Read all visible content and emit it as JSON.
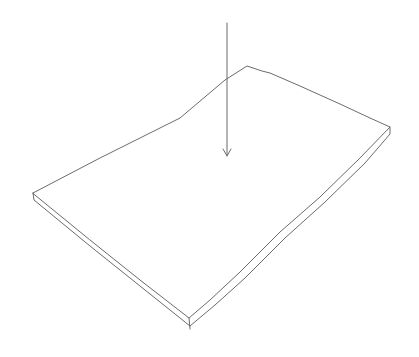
{
  "figure": {
    "colors": {
      "background": "#ffffff",
      "line": "#6b6b6b"
    },
    "plate": {
      "top_face": [
        [
          247,
          66
        ],
        [
          390,
          127
        ],
        [
          189,
          318
        ],
        [
          33,
          193
        ]
      ],
      "thickness": 6
    },
    "arrow": {
      "from": [
        227,
        23
      ],
      "to": [
        227,
        156
      ]
    }
  }
}
